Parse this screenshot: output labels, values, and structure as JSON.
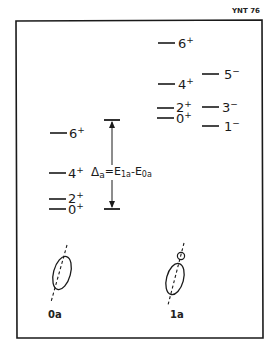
{
  "figure_tag": "YNT 76",
  "bands": [
    {
      "name": "0a",
      "caption": "0a",
      "levels": [
        {
          "spin": "6",
          "parity": "+"
        },
        {
          "spin": "4",
          "parity": "+"
        },
        {
          "spin": "2",
          "parity": "+"
        },
        {
          "spin": "0",
          "parity": "+"
        }
      ]
    },
    {
      "name": "1a-positive",
      "caption": "1a",
      "levels": [
        {
          "spin": "6",
          "parity": "+"
        },
        {
          "spin": "4",
          "parity": "+"
        },
        {
          "spin": "2",
          "parity": "+"
        },
        {
          "spin": "0",
          "parity": "+"
        }
      ]
    },
    {
      "name": "1a-negative",
      "levels": [
        {
          "spin": "5",
          "parity": "−"
        },
        {
          "spin": "3",
          "parity": "−"
        },
        {
          "spin": "1",
          "parity": "−"
        }
      ]
    }
  ],
  "energy_gap": {
    "symbol": "Δ",
    "subscript": "a",
    "equals": "=E",
    "term1_sub": "1a",
    "minus": "-E",
    "term2_sub": "0a"
  },
  "shapes": [
    {
      "label": "0a",
      "type": "ellipsoid with axis"
    },
    {
      "label": "1a",
      "type": "ellipsoid with alpha cluster"
    }
  ],
  "colors": {
    "ink": "#1a1a1a",
    "background": "#ffffff"
  }
}
